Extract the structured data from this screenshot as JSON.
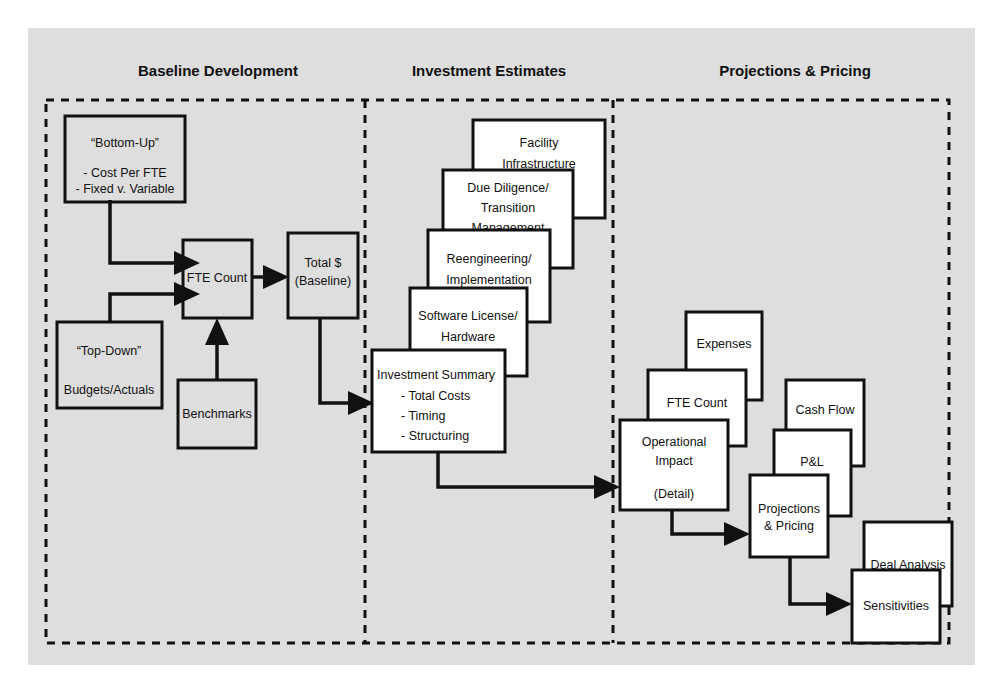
{
  "canvas": {
    "background_color": "#dedede",
    "page_color": "#ffffff",
    "line_color": "#111111",
    "box_fill": "#ffffff"
  },
  "sections": [
    {
      "id": "baseline",
      "title": "Baseline Development"
    },
    {
      "id": "investment",
      "title": "Investment Estimates"
    },
    {
      "id": "projections",
      "title": "Projections & Pricing"
    }
  ],
  "nodes": {
    "bottom_up": {
      "lines": [
        "“Bottom-Up”",
        "- Cost Per FTE",
        "- Fixed v. Variable"
      ],
      "title": "“Bottom-Up”",
      "bullet_1": "- Cost Per FTE",
      "bullet_2": "- Fixed v. Variable"
    },
    "top_down": {
      "title": "“Top-Down”",
      "subtitle": "Budgets/Actuals"
    },
    "fte_count_baseline": {
      "label": "FTE Count"
    },
    "benchmarks": {
      "label": "Benchmarks"
    },
    "total_dollar": {
      "line1": "Total $",
      "line2": "(Baseline)"
    },
    "facility_infrastructure": {
      "line1": "Facility",
      "line2": "Infrastructure"
    },
    "due_diligence": {
      "line1": "Due Diligence/",
      "line2": "Transition",
      "line3": "Management"
    },
    "reengineering": {
      "line1": "Reengineering/",
      "line2": "Implementation"
    },
    "software_license": {
      "line1": "Software License/",
      "line2": "Hardware"
    },
    "investment_summary": {
      "title": "Investment Summary",
      "bullet_1": "- Total Costs",
      "bullet_2": "- Timing",
      "bullet_3": "- Structuring"
    },
    "expenses": {
      "label": "Expenses"
    },
    "fte_count_projections": {
      "label": "FTE Count"
    },
    "operational_impact": {
      "line1": "Operational",
      "line2": "Impact",
      "line3": "(Detail)"
    },
    "cash_flow": {
      "label": "Cash Flow"
    },
    "pnl": {
      "label": "P&L"
    },
    "projections_pricing": {
      "line1": "Projections",
      "line2": "& Pricing"
    },
    "deal_analysis": {
      "label": "Deal Analysis"
    },
    "sensitivities": {
      "label": "Sensitivities"
    }
  }
}
